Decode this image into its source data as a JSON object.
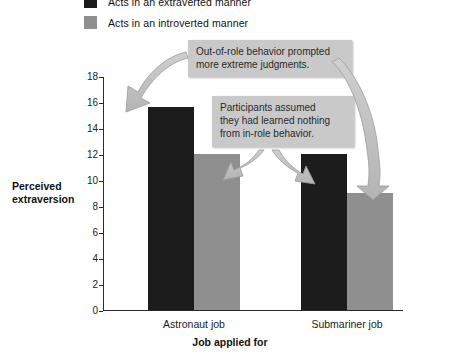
{
  "chart_data": {
    "type": "bar",
    "title": "",
    "xlabel": "Job applied for",
    "ylabel": "Perceived extraversion",
    "categories": [
      "Astronaut job",
      "Submariner job"
    ],
    "series": [
      {
        "name": "Acts in an extraverted manner",
        "color": "#1c1c1c",
        "values": [
          15.6,
          12.0
        ]
      },
      {
        "name": "Acts in an introverted manner",
        "color": "#8f8f8f",
        "values": [
          12.0,
          9.0
        ]
      }
    ],
    "ylim": [
      0,
      18
    ],
    "yticks": [
      0,
      2,
      4,
      6,
      8,
      10,
      12,
      14,
      16,
      18
    ],
    "ytick_labels": [
      "0",
      "2",
      "4",
      "6",
      "8",
      "10",
      "12",
      "14",
      "16",
      "18"
    ],
    "grid": false,
    "legend_position": "top-left",
    "annotations": [
      {
        "id": "callout-1",
        "text": "Out-of-role behavior prompted\nmore extreme judgments.",
        "points_to": [
          "astronaut-extraverted-bar",
          "submariner-introverted-bar"
        ]
      },
      {
        "id": "callout-2",
        "text": "Participants assumed\nthey had learned nothing\nfrom in-role behavior.",
        "points_to": [
          "astronaut-introverted-bar",
          "submariner-extraverted-bar"
        ]
      }
    ]
  },
  "legend": {
    "items": [
      {
        "label": "Acts in an extraverted manner",
        "color": "#1c1c1c"
      },
      {
        "label": "Acts in an introverted manner",
        "color": "#8f8f8f"
      }
    ]
  },
  "axes": {
    "y_title": "Perceived extraversion",
    "x_title": "Job applied for"
  }
}
